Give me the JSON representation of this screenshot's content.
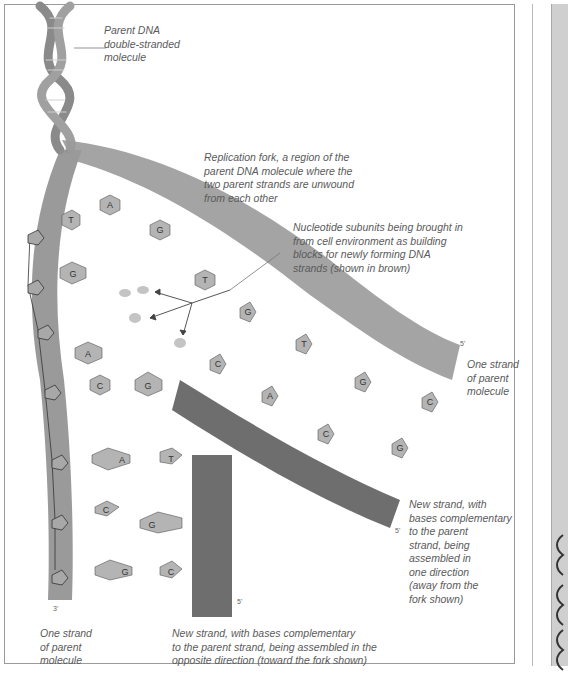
{
  "figure": {
    "labels": {
      "parent_dna": "Parent DNA\ndouble-stranded\nmolecule",
      "replication_fork": "Replication fork, a region of the\nparent DNA molecule where the\ntwo parent strands are unwound\nfrom each other",
      "nucleotide_subunits": "Nucleotide subunits being brought in\nfrom cell environment as building\nblocks for newly forming DNA\nstrands (shown in brown)",
      "parent_strand_right": "One strand\nof parent\nmolecule",
      "new_strand_right": "New strand, with\nbases complementary\nto the parent\nstrand, being\nassembled in\none direction\n(away from the\nfork shown)",
      "parent_strand_left": "One strand\nof parent\nmolecule",
      "new_strand_bottom": "New strand, with bases complementary\nto the parent strand, being assembled in the\nopposite direction  (toward the fork shown)"
    },
    "strand_ends": {
      "left_bottom": "3'",
      "vertical_new_bottom": "5'",
      "upper_right_end": "5'",
      "lower_right_end": "5'"
    },
    "base_pairs": {
      "left_unpaired": [
        "T",
        "A",
        "G",
        "A",
        "G",
        "C"
      ],
      "upper_free": [
        "G",
        "T"
      ],
      "diagonal_pairs": [
        [
          "G",
          "C"
        ],
        [
          "T",
          "A"
        ],
        [
          "G",
          "C"
        ],
        [
          "C",
          "G"
        ]
      ],
      "bottom_pairs": [
        [
          "A",
          "T"
        ],
        [
          "C",
          "G"
        ],
        [
          "G",
          "C"
        ]
      ]
    },
    "colors": {
      "parent_strand": "#8f8f8f",
      "new_strand": "#6e6e6e",
      "base_fill": "#b4b4b4",
      "label_text": "#5a5a5a",
      "frame_border": "#9a9a9a"
    }
  }
}
